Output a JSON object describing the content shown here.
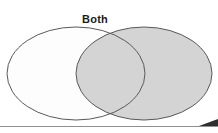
{
  "canvas": {
    "width": 218,
    "height": 133,
    "background_color": "#ffffff"
  },
  "artifact": {
    "clipped_text": "—— —"
  },
  "diagram": {
    "type": "venn",
    "title": "Both",
    "outline_color": "#595959",
    "outline_width": 1,
    "left_set": {
      "name": "left-set",
      "label": "",
      "fill_color": "#fdfdfd",
      "cx": 76,
      "cy": 73.5,
      "rx": 69,
      "ry": 46.5
    },
    "right_set": {
      "name": "right-set",
      "label": "",
      "fill_color": "#d4d4d4",
      "cx": 144,
      "cy": 73.5,
      "rx": 68,
      "ry": 46.5
    },
    "intersection": {
      "name": "both-region",
      "label": "Both",
      "fill_color": "#d4d4d4"
    }
  },
  "footer": {
    "rule_color": "#8f8f8f",
    "rule_y": 126,
    "corner_color": "#2e2e2e"
  }
}
